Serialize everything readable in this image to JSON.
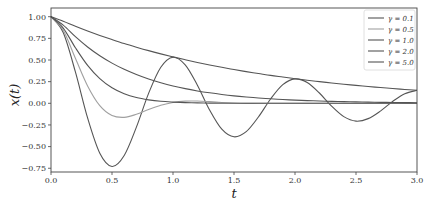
{
  "chart_data": {
    "type": "line",
    "title": "",
    "xlabel": "t",
    "ylabel": "x(t)",
    "xlim": [
      0.0,
      3.0
    ],
    "ylim": [
      -0.78,
      1.08
    ],
    "xticks": [
      0.0,
      0.5,
      1.0,
      1.5,
      2.0,
      2.5,
      3.0
    ],
    "xtick_labels": [
      "0.0",
      "0.5",
      "1.0",
      "1.5",
      "2.0",
      "2.5",
      "3.0"
    ],
    "yticks": [
      1.0,
      0.75,
      0.5,
      0.25,
      0.0,
      -0.25,
      -0.5,
      -0.75
    ],
    "ytick_labels": [
      "1.00",
      "0.75",
      "0.50",
      "0.25",
      "0.00",
      "−0.25",
      "−0.50",
      "−0.75"
    ],
    "grid": false,
    "legend_position": "upper right",
    "x": [
      0.0,
      0.1,
      0.2,
      0.3,
      0.4,
      0.5,
      0.6,
      0.7,
      0.8,
      0.9,
      1.0,
      1.1,
      1.2,
      1.3,
      1.4,
      1.5,
      1.6,
      1.7,
      1.8,
      1.9,
      2.0,
      2.1,
      2.2,
      2.3,
      2.4,
      2.5,
      2.6,
      2.7,
      2.8,
      2.9,
      3.0
    ],
    "series": [
      {
        "name": "γ = 0.1",
        "color": "#555555",
        "values": [
          1.0,
          0.817,
          0.362,
          -0.169,
          -0.576,
          -0.729,
          -0.602,
          -0.275,
          0.115,
          0.416,
          0.532,
          0.444,
          0.209,
          -0.077,
          -0.299,
          -0.387,
          -0.327,
          -0.158,
          0.05,
          0.215,
          0.282,
          0.241,
          0.119,
          -0.033,
          -0.154,
          -0.206,
          -0.177,
          -0.09,
          0.021,
          0.111,
          0.15
        ]
      },
      {
        "name": "γ = 0.5",
        "color": "#a0a0a0",
        "values": [
          1.0,
          0.843,
          0.52,
          0.201,
          -0.027,
          -0.141,
          -0.162,
          -0.127,
          -0.072,
          -0.023,
          0.01,
          0.025,
          0.026,
          0.019,
          0.01,
          0.003,
          -0.001,
          0.0,
          0.0,
          0.0,
          0.0,
          0.0,
          0.0,
          0.0,
          0.0,
          0.0,
          0.0,
          0.0,
          0.0,
          0.0,
          0.0
        ]
      },
      {
        "name": "γ = 1.0",
        "color": "#555555",
        "values": [
          1.0,
          0.869,
          0.642,
          0.438,
          0.285,
          0.179,
          0.11,
          0.066,
          0.04,
          0.023,
          0.014,
          0.008,
          0.0045,
          0.0025,
          0.0014,
          0.0008,
          0.0,
          0.0,
          0.0,
          0.0,
          0.0,
          0.0,
          0.0,
          0.0,
          0.0,
          0.0,
          0.0,
          0.0,
          0.0,
          0.0,
          0.0
        ]
      },
      {
        "name": "γ = 2.0",
        "color": "#555555",
        "values": [
          1.0,
          0.903,
          0.769,
          0.65,
          0.549,
          0.464,
          0.392,
          0.332,
          0.28,
          0.237,
          0.2,
          0.169,
          0.143,
          0.121,
          0.102,
          0.086,
          0.073,
          0.062,
          0.052,
          0.044,
          0.037,
          0.031,
          0.027,
          0.022,
          0.019,
          0.016,
          0.014,
          0.011,
          0.01,
          0.008,
          0.007
        ]
      },
      {
        "name": "γ = 5.0",
        "color": "#555555",
        "values": [
          1.0,
          0.948,
          0.89,
          0.835,
          0.784,
          0.736,
          0.69,
          0.648,
          0.608,
          0.571,
          0.536,
          0.503,
          0.472,
          0.443,
          0.416,
          0.39,
          0.366,
          0.344,
          0.322,
          0.303,
          0.284,
          0.267,
          0.25,
          0.235,
          0.22,
          0.207,
          0.194,
          0.182,
          0.171,
          0.16,
          0.151
        ]
      }
    ]
  },
  "legend": {
    "items": [
      {
        "label": "γ = 0.1"
      },
      {
        "label": "γ = 0.5"
      },
      {
        "label": "γ = 1.0"
      },
      {
        "label": "γ = 2.0"
      },
      {
        "label": "γ = 5.0"
      }
    ]
  },
  "axes": {
    "xlabel": "t",
    "ylabel": "x(t)",
    "frame_color": "#444444"
  }
}
